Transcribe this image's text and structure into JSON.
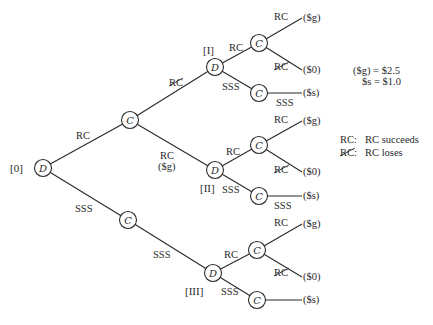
{
  "diagram": {
    "type": "decision-tree",
    "colors": {
      "ink": "#2a2a2a",
      "background": "#ffffff"
    },
    "nodes": [
      {
        "id": "d0",
        "kind": "D",
        "x": 43,
        "y": 168,
        "tag": "[0]"
      },
      {
        "id": "c1",
        "kind": "C",
        "x": 130,
        "y": 120
      },
      {
        "id": "c2",
        "kind": "C",
        "x": 128,
        "y": 220
      },
      {
        "id": "dI",
        "kind": "D",
        "x": 215,
        "y": 67,
        "tag": "[I]"
      },
      {
        "id": "dII",
        "kind": "D",
        "x": 215,
        "y": 170,
        "tag": "[II]"
      },
      {
        "id": "dIII",
        "kind": "D",
        "x": 213,
        "y": 273,
        "tag": "[III]"
      },
      {
        "id": "cIa",
        "kind": "C",
        "x": 259,
        "y": 43
      },
      {
        "id": "cIb",
        "kind": "C",
        "x": 259,
        "y": 93
      },
      {
        "id": "cIIa",
        "kind": "C",
        "x": 259,
        "y": 145
      },
      {
        "id": "cIIb",
        "kind": "C",
        "x": 259,
        "y": 196
      },
      {
        "id": "cIIIa",
        "kind": "C",
        "x": 257,
        "y": 250
      },
      {
        "id": "cIIIb",
        "kind": "C",
        "x": 257,
        "y": 300
      }
    ],
    "edges": [
      {
        "from": "d0",
        "to": "c1",
        "label": "RC",
        "negated": false
      },
      {
        "from": "d0",
        "to": "c2",
        "label": "SSS",
        "negated": false
      },
      {
        "from": "c1",
        "to": "dI",
        "label": "RC",
        "negated": true
      },
      {
        "from": "c1",
        "to": "dII",
        "label": "RC",
        "negated": false,
        "sublabel": "($g)"
      },
      {
        "from": "c2",
        "to": "dIII",
        "label": "SSS",
        "negated": false
      },
      {
        "from": "dI",
        "to": "cIa",
        "label": "RC",
        "negated": false
      },
      {
        "from": "dI",
        "to": "cIb",
        "label": "SSS",
        "negated": false
      },
      {
        "from": "dII",
        "to": "cIIa",
        "label": "RC",
        "negated": false
      },
      {
        "from": "dII",
        "to": "cIIb",
        "label": "SSS",
        "negated": false
      },
      {
        "from": "dIII",
        "to": "cIIIa",
        "label": "RC",
        "negated": false
      },
      {
        "from": "dIII",
        "to": "cIIIb",
        "label": "SSS",
        "negated": false
      }
    ],
    "payoffs": [
      {
        "from": "cIa",
        "label": "RC",
        "negated": false,
        "value": "($g)"
      },
      {
        "from": "cIa",
        "label": "RC",
        "negated": true,
        "value": "($0)"
      },
      {
        "from": "cIb",
        "label": "SSS",
        "negated": false,
        "value": "($s)"
      },
      {
        "from": "cIIa",
        "label": "RC",
        "negated": false,
        "value": "($g)"
      },
      {
        "from": "cIIa",
        "label": "RC",
        "negated": true,
        "value": "($0)"
      },
      {
        "from": "cIIb",
        "label": "SSS",
        "negated": false,
        "value": "($s)"
      },
      {
        "from": "cIIIa",
        "label": "RC",
        "negated": false,
        "value": "($g)"
      },
      {
        "from": "cIIIa",
        "label": "RC",
        "negated": true,
        "value": "($0)"
      },
      {
        "from": "cIIIb",
        "label": "",
        "negated": false,
        "value": "($s)"
      }
    ]
  },
  "text": {
    "tag_0": "[0]",
    "tag_I": "[I]",
    "tag_II": "[II]",
    "tag_III": "[III]",
    "node_D": "D",
    "node_C": "C",
    "rc": "RC",
    "sss": "SSS",
    "pay_g": "($g)",
    "pay_0": "($0)",
    "pay_s": "($s)",
    "sub_g": "($g)"
  },
  "values": {
    "line1": "($g) = $2.5",
    "line2": "$s = $1.0"
  },
  "legend": {
    "items": [
      {
        "key": "RC:",
        "key_negated": false,
        "desc": "RC succeeds"
      },
      {
        "key": "RC:",
        "key_negated": true,
        "desc": "RC loses"
      }
    ]
  }
}
